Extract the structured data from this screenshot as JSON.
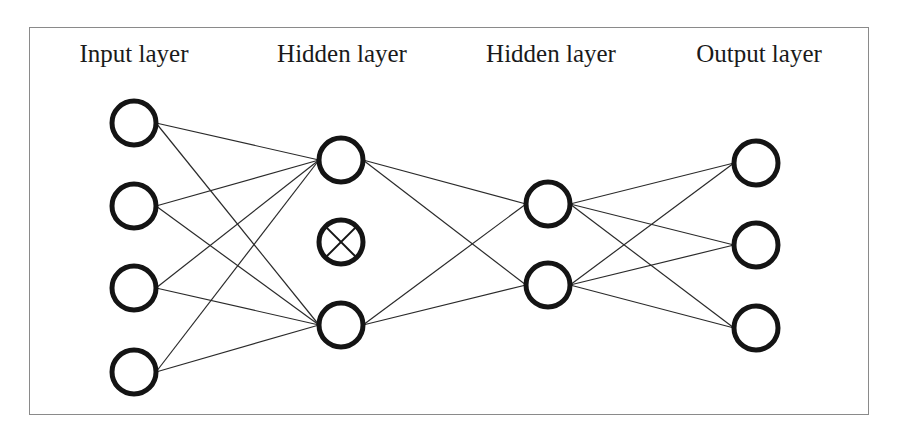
{
  "diagram": {
    "layers": [
      {
        "id": "input",
        "label": "Input layer",
        "label_x": 134,
        "node_x": 134,
        "nodes": [
          {
            "y": 123,
            "dropped": false
          },
          {
            "y": 206,
            "dropped": false
          },
          {
            "y": 288,
            "dropped": false
          },
          {
            "y": 372,
            "dropped": false
          }
        ]
      },
      {
        "id": "hidden1",
        "label": "Hidden layer",
        "label_x": 342,
        "node_x": 341,
        "nodes": [
          {
            "y": 160,
            "dropped": false
          },
          {
            "y": 242,
            "dropped": true
          },
          {
            "y": 325,
            "dropped": false
          }
        ]
      },
      {
        "id": "hidden2",
        "label": "Hidden layer",
        "label_x": 551,
        "node_x": 548,
        "nodes": [
          {
            "y": 204,
            "dropped": false
          },
          {
            "y": 285,
            "dropped": false
          }
        ]
      },
      {
        "id": "output",
        "label": "Output layer",
        "label_x": 759,
        "node_x": 756,
        "nodes": [
          {
            "y": 163,
            "dropped": false
          },
          {
            "y": 245,
            "dropped": false
          },
          {
            "y": 328,
            "dropped": false
          }
        ]
      }
    ],
    "connections": "fully connected between adjacent layers, excluding dropped nodes",
    "node_radius": 22,
    "node_stroke": "#141414",
    "edge_color": "#2a2a2a",
    "frame_color": "#8a8a8a"
  }
}
